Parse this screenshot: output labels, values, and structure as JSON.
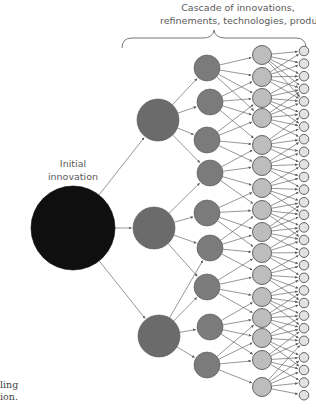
{
  "labels": {
    "cascade_line1": "Cascade of innovations,",
    "cascade_line2": "refinements, technologies, products",
    "initial_line1": "Initial",
    "initial_line2": "innovation",
    "caption_line1": "ling",
    "caption_line2": "ion."
  },
  "colors": {
    "initial": "#0f0f0f",
    "level2": "#6b6b6b",
    "level3": "#7b7b7b",
    "level4": "#bdbdbd",
    "level5": "#e2e2e2",
    "stroke": "#555555",
    "arrow": "#6a6a6a"
  },
  "structure": {
    "levels": [
      {
        "name": "initial-innovation",
        "count": 1
      },
      {
        "name": "level-2",
        "count": 3
      },
      {
        "name": "level-3",
        "count": 9
      },
      {
        "name": "level-4",
        "count": 16
      },
      {
        "name": "level-5",
        "count": 28
      }
    ]
  }
}
